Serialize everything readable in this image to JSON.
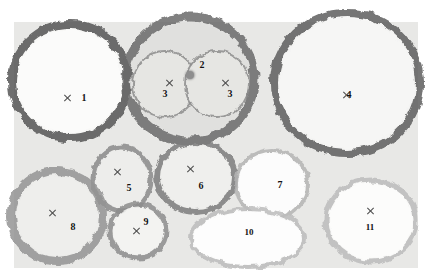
{
  "image": {
    "title": "Bacterial colony plate",
    "width": 432,
    "height": 271,
    "background_color": "#ffffff",
    "dish_color": "#e8e8e6",
    "marker_color": "#4a4a4a",
    "label_color": "#121212"
  },
  "colonies": [
    {
      "id": "colony-1",
      "label": "1",
      "cx": 70,
      "cy": 81,
      "rx": 58,
      "ry": 57,
      "fill": "#fbfbfa",
      "rim": "#555555",
      "rim_width": 8,
      "marker": "x",
      "marker_x": 67,
      "marker_y": 98,
      "label_x": 84,
      "label_y": 98
    },
    {
      "id": "colony-2",
      "label": "2",
      "cx": 190,
      "cy": 79,
      "rx": 64,
      "ry": 62,
      "fill": "#e0e0de",
      "rim": "#6a6a6a",
      "rim_width": 9,
      "marker": "dot",
      "marker_x": 190,
      "marker_y": 75,
      "label_x": 202,
      "label_y": 65
    },
    {
      "id": "colony-3a",
      "label": "3",
      "cx": 165,
      "cy": 84,
      "rx": 32,
      "ry": 33,
      "fill": "#e6e6e3",
      "rim": "#8d8d8d",
      "rim_width": 2,
      "marker": "x",
      "marker_x": 169,
      "marker_y": 83,
      "label_x": 165,
      "label_y": 94
    },
    {
      "id": "colony-3b",
      "label": "3",
      "cx": 217,
      "cy": 84,
      "rx": 32,
      "ry": 33,
      "fill": "#e6e6e3",
      "rim": "#8d8d8d",
      "rim_width": 2,
      "marker": "x",
      "marker_x": 225,
      "marker_y": 83,
      "label_x": 230,
      "label_y": 94
    },
    {
      "id": "colony-4",
      "label": "4",
      "cx": 347,
      "cy": 83,
      "rx": 73,
      "ry": 70,
      "fill": "#f6f6f5",
      "rim": "#5d5d5d",
      "rim_width": 8,
      "marker": "x",
      "marker_x": 346,
      "marker_y": 95,
      "label_x": 349,
      "label_y": 95
    },
    {
      "id": "colony-5",
      "label": "5",
      "cx": 122,
      "cy": 179,
      "rx": 29,
      "ry": 32,
      "fill": "#ededeb",
      "rim": "#8a8a8a",
      "rim_width": 5,
      "marker": "x",
      "marker_x": 117,
      "marker_y": 172,
      "label_x": 129,
      "label_y": 188
    },
    {
      "id": "colony-6",
      "label": "6",
      "cx": 196,
      "cy": 177,
      "rx": 39,
      "ry": 35,
      "fill": "#efefed",
      "rim": "#7d7d7d",
      "rim_width": 6,
      "marker": "x",
      "marker_x": 190,
      "marker_y": 169,
      "label_x": 201,
      "label_y": 186
    },
    {
      "id": "colony-7",
      "label": "7",
      "cx": 272,
      "cy": 184,
      "rx": 36,
      "ry": 34,
      "fill": "#fcfcfc",
      "rim": "#b4b4b4",
      "rim_width": 4,
      "marker": "none",
      "marker_x": 0,
      "marker_y": 0,
      "label_x": 280,
      "label_y": 185
    },
    {
      "id": "colony-8",
      "label": "8",
      "cx": 57,
      "cy": 216,
      "rx": 46,
      "ry": 45,
      "fill": "#eeeeec",
      "rim": "#949494",
      "rim_width": 8,
      "marker": "x",
      "marker_x": 52,
      "marker_y": 213,
      "label_x": 73,
      "label_y": 227
    },
    {
      "id": "colony-9",
      "label": "9",
      "cx": 138,
      "cy": 231,
      "rx": 28,
      "ry": 27,
      "fill": "#f3f3f1",
      "rim": "#8c8c8c",
      "rim_width": 5,
      "marker": "x",
      "marker_x": 136,
      "marker_y": 231,
      "label_x": 146,
      "label_y": 222
    },
    {
      "id": "colony-10",
      "label": "10",
      "cx": 248,
      "cy": 238,
      "rx": 57,
      "ry": 29,
      "fill": "#fdfdfd",
      "rim": "#bdbdbd",
      "rim_width": 4,
      "marker": "none",
      "marker_x": 0,
      "marker_y": 0,
      "label_x": 249,
      "label_y": 232
    },
    {
      "id": "colony-11",
      "label": "11",
      "cx": 371,
      "cy": 221,
      "rx": 45,
      "ry": 41,
      "fill": "#fcfcfb",
      "rim": "#bcbcbc",
      "rim_width": 5,
      "marker": "x",
      "marker_x": 370,
      "marker_y": 211,
      "label_x": 370,
      "label_y": 227
    }
  ]
}
